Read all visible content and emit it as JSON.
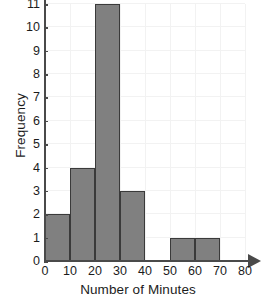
{
  "chart_data": {
    "type": "bar",
    "title": "",
    "subtitle": "",
    "xlabel": "Number of Minutes",
    "ylabel": "Frequency",
    "categories": [
      "0-10",
      "10-20",
      "20-30",
      "30-40",
      "40-50",
      "50-60",
      "60-70",
      "70-80"
    ],
    "bin_edges": [
      0,
      10,
      20,
      30,
      40,
      50,
      60,
      70,
      80
    ],
    "values": [
      2,
      4,
      11,
      3,
      0,
      1,
      1,
      0
    ],
    "bin_width": 10,
    "xlim": [
      0,
      80
    ],
    "ylim": [
      0,
      11
    ],
    "xticks": [
      "0",
      "10",
      "20",
      "30",
      "40",
      "50",
      "60",
      "70",
      "80"
    ],
    "xtick_values": [
      0,
      10,
      20,
      30,
      40,
      50,
      60,
      70,
      80
    ],
    "yticks": [
      "0",
      "1",
      "2",
      "3",
      "4",
      "5",
      "6",
      "7",
      "8",
      "9",
      "10",
      "11"
    ],
    "ytick_values": [
      0,
      1,
      2,
      3,
      4,
      5,
      6,
      7,
      8,
      9,
      10,
      11
    ],
    "grid": true,
    "legend": false,
    "legend_position": "none",
    "bar_color": "#808080",
    "bar_edge_color": "#3a3a3a",
    "axis_color": "#4a4a4a",
    "grid_color": "#f2f2f2",
    "background_color": "#ffffff",
    "annotations": [],
    "x_axis_has_arrow": true,
    "total_frequency": 22
  }
}
